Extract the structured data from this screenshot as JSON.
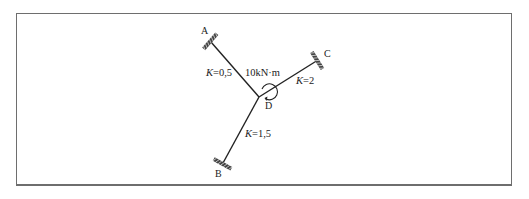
{
  "diagram": {
    "type": "moment distribution frame",
    "joint": {
      "name": "D",
      "x": 259,
      "y": 97
    },
    "applied_moment": {
      "label": "10kN·m",
      "direction": "clockwise"
    },
    "members": [
      {
        "name": "DA",
        "end": "A",
        "stiffness_label": "K=0.5",
        "k_prefix": "K",
        "k_value": "=0.5",
        "support": "fixed",
        "end_x": 211,
        "end_y": 42
      },
      {
        "name": "DC",
        "end": "C",
        "stiffness_label": "K=2",
        "k_prefix": "K",
        "k_value": "=2",
        "support": "fixed",
        "end_x": 318,
        "end_y": 60
      },
      {
        "name": "DB",
        "end": "B",
        "stiffness_label": "K=1.5",
        "k_prefix": "K",
        "k_value": "=1.5",
        "support": "fixed",
        "end_x": 223,
        "end_y": 163
      }
    ],
    "labels": {
      "A": "A",
      "B": "B",
      "C": "C",
      "D": "D",
      "moment": "10kN·m",
      "kA_prefix": "K",
      "kA_value": "=0,5",
      "kC_prefix": "K",
      "kC_value": "=2",
      "kB_prefix": "K",
      "kB_value": "=1,5"
    },
    "colors": {
      "line": "#222222",
      "frame": "#6e6e6e"
    }
  }
}
